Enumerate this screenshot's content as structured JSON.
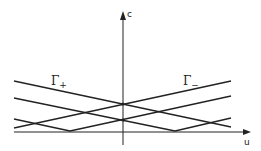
{
  "diagram": {
    "axes": {
      "x_label": "u",
      "y_label": "c"
    },
    "curves": [
      {
        "name": "Γ+",
        "label_main": "Γ",
        "label_sub": "+"
      },
      {
        "name": "Γ-",
        "label_main": "Γ",
        "label_sub": "−"
      }
    ],
    "colors": {
      "stroke": "#222222",
      "background": "#ffffff"
    }
  }
}
